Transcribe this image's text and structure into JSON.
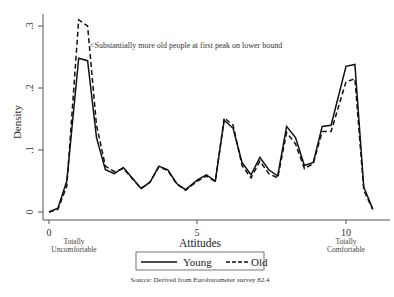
{
  "chart_data": {
    "type": "line",
    "title": "",
    "xlabel": "Attitudes",
    "ylabel": "Density",
    "xlim": [
      0,
      11
    ],
    "ylim": [
      0,
      0.31
    ],
    "x_ticks": [
      "0",
      "5",
      "10"
    ],
    "y_ticks": [
      "0",
      ".1",
      ".2",
      ".3"
    ],
    "x_tick_sublabels": {
      "0": [
        "Totally",
        "Uncomfortable"
      ],
      "10": [
        "Totally",
        "Comfortable"
      ]
    },
    "grid": false,
    "legend_position": "bottom",
    "annotation": "<Substantially more old people at first peak on lower bound",
    "source_note": "Source: Derived from Eurobarometer survey 82.4",
    "x": [
      0,
      0.3,
      0.6,
      1.0,
      1.3,
      1.6,
      1.9,
      2.2,
      2.5,
      2.8,
      3.1,
      3.4,
      3.7,
      4.0,
      4.3,
      4.6,
      5.0,
      5.3,
      5.6,
      5.9,
      6.2,
      6.5,
      6.8,
      7.1,
      7.4,
      7.7,
      8.0,
      8.3,
      8.6,
      8.9,
      9.2,
      9.5,
      10.0,
      10.3,
      10.6,
      10.9
    ],
    "series": [
      {
        "name": "Young",
        "style": "solid",
        "values": [
          0.0,
          0.006,
          0.05,
          0.248,
          0.244,
          0.12,
          0.068,
          0.062,
          0.072,
          0.055,
          0.038,
          0.048,
          0.074,
          0.068,
          0.046,
          0.036,
          0.052,
          0.06,
          0.05,
          0.148,
          0.135,
          0.08,
          0.06,
          0.088,
          0.068,
          0.058,
          0.138,
          0.12,
          0.075,
          0.08,
          0.138,
          0.14,
          0.235,
          0.238,
          0.04,
          0.005
        ]
      },
      {
        "name": "Old",
        "style": "dashed",
        "values": [
          0.0,
          0.004,
          0.042,
          0.31,
          0.3,
          0.14,
          0.074,
          0.065,
          0.07,
          0.054,
          0.038,
          0.048,
          0.073,
          0.067,
          0.045,
          0.035,
          0.05,
          0.058,
          0.049,
          0.152,
          0.14,
          0.075,
          0.055,
          0.082,
          0.062,
          0.055,
          0.128,
          0.11,
          0.07,
          0.078,
          0.13,
          0.13,
          0.21,
          0.215,
          0.035,
          0.004
        ]
      }
    ]
  }
}
